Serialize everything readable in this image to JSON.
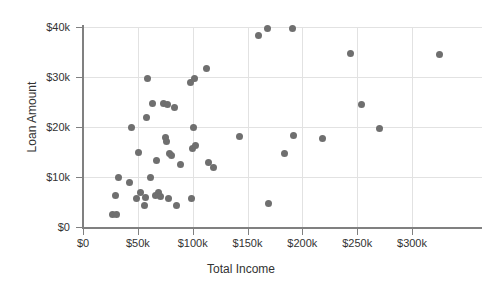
{
  "chart_data": {
    "type": "scatter",
    "title": "",
    "xlabel": "Total Income",
    "ylabel": "Loan Amount",
    "xlim": [
      0,
      300000
    ],
    "ylim": [
      0,
      40000
    ],
    "grid": true,
    "legend": "none",
    "marker_color": "#6f6f6f",
    "gridline_color": "#e2e2e2",
    "axis_color": "#808080",
    "x_ticks": [
      {
        "value": 0,
        "label": "$0"
      },
      {
        "value": 50000,
        "label": "$50k"
      },
      {
        "value": 100000,
        "label": "$100k"
      },
      {
        "value": 150000,
        "label": "$150k"
      },
      {
        "value": 200000,
        "label": "$200k"
      },
      {
        "value": 250000,
        "label": "$250k"
      },
      {
        "value": 300000,
        "label": "$300k"
      }
    ],
    "y_ticks": [
      {
        "value": 0,
        "label": "$0"
      },
      {
        "value": 10000,
        "label": "$10k"
      },
      {
        "value": 20000,
        "label": "$20k"
      },
      {
        "value": 30000,
        "label": "$30k"
      },
      {
        "value": 40000,
        "label": "$40k"
      }
    ],
    "points": [
      {
        "x": 27000,
        "y": 2600
      },
      {
        "x": 31000,
        "y": 2600
      },
      {
        "x": 30000,
        "y": 6300
      },
      {
        "x": 32000,
        "y": 10000
      },
      {
        "x": 42000,
        "y": 8900
      },
      {
        "x": 44000,
        "y": 19900
      },
      {
        "x": 49000,
        "y": 5700
      },
      {
        "x": 51000,
        "y": 15000
      },
      {
        "x": 52000,
        "y": 6900
      },
      {
        "x": 56000,
        "y": 4300
      },
      {
        "x": 57000,
        "y": 6000
      },
      {
        "x": 58000,
        "y": 21900
      },
      {
        "x": 59000,
        "y": 29800
      },
      {
        "x": 62000,
        "y": 10000
      },
      {
        "x": 63000,
        "y": 24800
      },
      {
        "x": 66000,
        "y": 6300
      },
      {
        "x": 67000,
        "y": 13400
      },
      {
        "x": 69000,
        "y": 7000
      },
      {
        "x": 71000,
        "y": 6200
      },
      {
        "x": 73000,
        "y": 24800
      },
      {
        "x": 75000,
        "y": 17900
      },
      {
        "x": 76000,
        "y": 17200
      },
      {
        "x": 77000,
        "y": 24600
      },
      {
        "x": 78000,
        "y": 5800
      },
      {
        "x": 79000,
        "y": 14800
      },
      {
        "x": 81000,
        "y": 14300
      },
      {
        "x": 83000,
        "y": 23900
      },
      {
        "x": 85000,
        "y": 4300
      },
      {
        "x": 89000,
        "y": 12600
      },
      {
        "x": 98000,
        "y": 29000
      },
      {
        "x": 99000,
        "y": 5700
      },
      {
        "x": 100000,
        "y": 15800
      },
      {
        "x": 101000,
        "y": 19900
      },
      {
        "x": 102000,
        "y": 29700
      },
      {
        "x": 103000,
        "y": 16400
      },
      {
        "x": 113000,
        "y": 31800
      },
      {
        "x": 114000,
        "y": 13000
      },
      {
        "x": 119000,
        "y": 11900
      },
      {
        "x": 143000,
        "y": 18100
      },
      {
        "x": 160000,
        "y": 38400
      },
      {
        "x": 168000,
        "y": 39800
      },
      {
        "x": 169000,
        "y": 4700
      },
      {
        "x": 184000,
        "y": 14700
      },
      {
        "x": 191000,
        "y": 39800
      },
      {
        "x": 192000,
        "y": 18300
      },
      {
        "x": 218000,
        "y": 17800
      },
      {
        "x": 244000,
        "y": 34700
      },
      {
        "x": 254000,
        "y": 24600
      },
      {
        "x": 270000,
        "y": 19700
      },
      {
        "x": 325000,
        "y": 34600
      }
    ]
  }
}
